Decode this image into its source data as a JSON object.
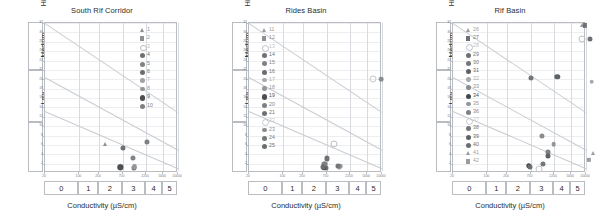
{
  "figure": {
    "xlabel": "Conductivity (µS/cm)",
    "ylabel": "SAR",
    "bands": [
      "High",
      "Medium",
      "Low"
    ],
    "x_tick_labels": [
      "20",
      "100",
      "250",
      "750",
      "2250",
      "5000",
      "10000"
    ],
    "class_labels": [
      "0",
      "1",
      "2",
      "3",
      "4",
      "5"
    ],
    "y_tick_labels": [
      "32",
      "30",
      "28",
      "26",
      "24",
      "22",
      "20",
      "18",
      "16",
      "14",
      "12",
      "10",
      "8",
      "6",
      "4",
      "2"
    ]
  },
  "chart_data": [
    {
      "type": "scatter",
      "title": "South Rif Corridor",
      "xlabel": "Conductivity (µS/cm)",
      "ylabel": "SAR",
      "xscale": "log",
      "xlim": [
        20,
        10000
      ],
      "ylim": [
        0,
        32
      ],
      "grid": true,
      "legend_position": "upper-right",
      "legend": [
        "1",
        "2",
        "3",
        "4",
        "5",
        "6",
        "7",
        "8",
        "9",
        "10"
      ],
      "points": [
        {
          "label": "1",
          "x": 330,
          "y": 6.2
        },
        {
          "label": "2",
          "x": 700,
          "y": 1.3
        },
        {
          "label": "3",
          "x": 690,
          "y": 1.3
        },
        {
          "label": "4",
          "x": 760,
          "y": 5.4
        },
        {
          "label": "5",
          "x": 1200,
          "y": 3.2
        },
        {
          "label": "6",
          "x": 1250,
          "y": 1.1
        },
        {
          "label": "7",
          "x": 1320,
          "y": 1.5
        },
        {
          "label": "8",
          "x": 1300,
          "y": 1.2
        },
        {
          "label": "9",
          "x": 680,
          "y": 1.2
        },
        {
          "label": "10",
          "x": 2300,
          "y": 6.6
        }
      ]
    },
    {
      "type": "scatter",
      "title": "Rides Basin",
      "xlabel": "Conductivity (µS/cm)",
      "ylabel": "SAR",
      "xscale": "log",
      "xlim": [
        20,
        10000
      ],
      "ylim": [
        0,
        32
      ],
      "grid": true,
      "legend_position": "upper-left",
      "legend": [
        "11",
        "12",
        "13",
        "14",
        "15",
        "16",
        "17",
        "18",
        "19",
        "20",
        "21",
        "22",
        "23",
        "24",
        "25"
      ],
      "points": [
        {
          "label": "11",
          "x": 700,
          "y": 1.2
        },
        {
          "label": "12",
          "x": 690,
          "y": 1.6
        },
        {
          "label": "13",
          "x": 1050,
          "y": 6.2
        },
        {
          "label": "14",
          "x": 720,
          "y": 1.0
        },
        {
          "label": "15",
          "x": 660,
          "y": 1.9
        },
        {
          "label": "16",
          "x": 670,
          "y": 1.4
        },
        {
          "label": "17",
          "x": 1350,
          "y": 1.3
        },
        {
          "label": "18",
          "x": 1400,
          "y": 1.5
        },
        {
          "label": "19",
          "x": 660,
          "y": 1.1
        },
        {
          "label": "20",
          "x": 700,
          "y": 2.0
        },
        {
          "label": "21",
          "x": 780,
          "y": 3.1
        },
        {
          "label": "22",
          "x": 6500,
          "y": 20.0
        },
        {
          "label": "23",
          "x": 9500,
          "y": 20.0
        },
        {
          "label": "24",
          "x": 1300,
          "y": 1.6
        },
        {
          "label": "25",
          "x": 640,
          "y": 1.3
        }
      ]
    },
    {
      "type": "scatter",
      "title": "Rif Basin",
      "xlabel": "Conductivity (µS/cm)",
      "ylabel": "SAR",
      "xscale": "log",
      "xlim": [
        20,
        10000
      ],
      "ylim": [
        0,
        32
      ],
      "grid": true,
      "legend_position": "upper-left",
      "legend": [
        "26",
        "27",
        "28",
        "29",
        "30",
        "31",
        "32",
        "33",
        "34",
        "35",
        "36",
        "37",
        "38",
        "39",
        "40",
        "41",
        "42"
      ],
      "points": [
        {
          "label": "26",
          "x": 8200,
          "y": 31.5
        },
        {
          "label": "27",
          "x": 9600,
          "y": 31.5
        },
        {
          "label": "28",
          "x": 8300,
          "y": 28.5
        },
        {
          "label": "29",
          "x": 12000,
          "y": 28.5
        },
        {
          "label": "30",
          "x": 760,
          "y": 20.2
        },
        {
          "label": "31",
          "x": 2600,
          "y": 20.5
        },
        {
          "label": "32",
          "x": 13000,
          "y": 19.5
        },
        {
          "label": "33",
          "x": 1250,
          "y": 7.8
        },
        {
          "label": "34",
          "x": 700,
          "y": 1.5
        },
        {
          "label": "35",
          "x": 2200,
          "y": 6.2
        },
        {
          "label": "36",
          "x": 1700,
          "y": 4.4
        },
        {
          "label": "37",
          "x": 1100,
          "y": 0.9
        },
        {
          "label": "38",
          "x": 1350,
          "y": 2.0
        },
        {
          "label": "39",
          "x": 1700,
          "y": 3.6
        },
        {
          "label": "40",
          "x": 740,
          "y": 1.3
        },
        {
          "label": "41",
          "x": 14000,
          "y": 4.2
        },
        {
          "label": "42",
          "x": 11500,
          "y": 2.8
        }
      ]
    }
  ],
  "symbols": {
    "1": {
      "shape": "triangle",
      "color": "#8c8f93",
      "size": 2.6
    },
    "2": {
      "shape": "square",
      "color": "#8c8f93",
      "size": 2.4
    },
    "3": {
      "shape": "open",
      "color": "#b9bcc0",
      "size": 2.6
    },
    "4": {
      "shape": "circle",
      "color": "#6e7174",
      "size": 2.8
    },
    "5": {
      "shape": "circle",
      "color": "#808386",
      "size": 2.8
    },
    "6": {
      "shape": "circle",
      "color": "#6b6e71",
      "size": 2.8
    },
    "7": {
      "shape": "circle",
      "color": "#a0a3a6",
      "size": 2.6
    },
    "8": {
      "shape": "circle",
      "color": "#93969a",
      "size": 2.6
    },
    "9": {
      "shape": "circle",
      "color": "#4c4f52",
      "size": 3.0
    },
    "10": {
      "shape": "circle",
      "color": "#7e8184",
      "size": 2.8
    },
    "11": {
      "shape": "triangle",
      "color": "#9a9da0",
      "size": 2.6
    },
    "12": {
      "shape": "square",
      "color": "#8c8f93",
      "size": 2.4
    },
    "13": {
      "shape": "open",
      "color": "#bcbfc3",
      "size": 2.8
    },
    "14": {
      "shape": "circle",
      "color": "#6e7174",
      "size": 2.8
    },
    "15": {
      "shape": "circle",
      "color": "#808386",
      "size": 2.8
    },
    "16": {
      "shape": "circle",
      "color": "#6b6e71",
      "size": 2.8
    },
    "17": {
      "shape": "circle",
      "color": "#a8abae",
      "size": 2.6
    },
    "18": {
      "shape": "circle",
      "color": "#93969a",
      "size": 2.6
    },
    "19": {
      "shape": "circle",
      "color": "#4c4f52",
      "size": 3.0
    },
    "20": {
      "shape": "circle",
      "color": "#7e8184",
      "size": 2.8
    },
    "21": {
      "shape": "circle",
      "color": "#6f7275",
      "size": 2.8
    },
    "22": {
      "shape": "open",
      "color": "#c4c7cb",
      "size": 2.8
    },
    "23": {
      "shape": "circle",
      "color": "#8a8d90",
      "size": 2.6
    },
    "24": {
      "shape": "circle",
      "color": "#74777a",
      "size": 2.8
    },
    "25": {
      "shape": "circle",
      "color": "#6b6e71",
      "size": 2.8
    },
    "26": {
      "shape": "triangle",
      "color": "#9a9da0",
      "size": 2.6
    },
    "27": {
      "shape": "square",
      "color": "#6e7174",
      "size": 2.4
    },
    "28": {
      "shape": "open",
      "color": "#bcbfc3",
      "size": 2.8
    },
    "29": {
      "shape": "circle",
      "color": "#6e7174",
      "size": 2.8
    },
    "30": {
      "shape": "circle",
      "color": "#74777a",
      "size": 2.8
    },
    "31": {
      "shape": "circle",
      "color": "#5f6265",
      "size": 3.0
    },
    "32": {
      "shape": "circle",
      "color": "#a8abae",
      "size": 2.6
    },
    "33": {
      "shape": "circle",
      "color": "#8a8d90",
      "size": 2.8
    },
    "34": {
      "shape": "circle",
      "color": "#44474a",
      "size": 3.0
    },
    "35": {
      "shape": "circle",
      "color": "#93969a",
      "size": 2.6
    },
    "36": {
      "shape": "circle",
      "color": "#7e8184",
      "size": 2.8
    },
    "37": {
      "shape": "open",
      "color": "#c4c7cb",
      "size": 2.8
    },
    "38": {
      "shape": "circle",
      "color": "#74777a",
      "size": 2.8
    },
    "39": {
      "shape": "circle",
      "color": "#5f6265",
      "size": 2.8
    },
    "40": {
      "shape": "circle",
      "color": "#6b6e71",
      "size": 2.8
    },
    "41": {
      "shape": "triangle",
      "color": "#9a9da0",
      "size": 2.6
    },
    "42": {
      "shape": "square",
      "color": "#9a9da0",
      "size": 2.4
    }
  }
}
